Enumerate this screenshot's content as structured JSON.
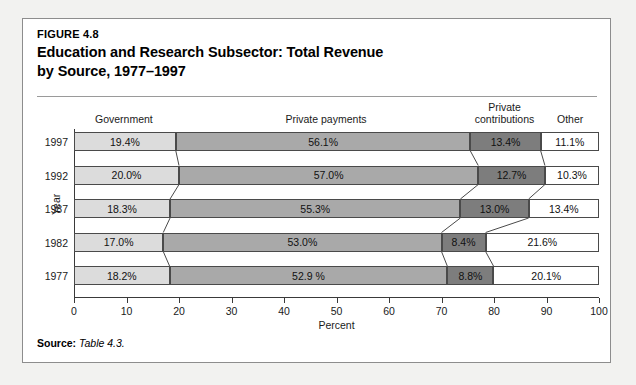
{
  "figure": {
    "number": "FIGURE 4.8",
    "title_line1": "Education and Research Subsector: Total Revenue",
    "title_line2": "by Source, 1977–1997",
    "source_label": "Source:",
    "source_text": "Table 4.3."
  },
  "headers": [
    {
      "label": "Government",
      "center_pct": 9.5
    },
    {
      "label": "Private payments",
      "center_pct": 48
    },
    {
      "label": "Private\ncontributions",
      "line1": "Private",
      "line2": "contributions",
      "center_pct": 82
    },
    {
      "label": "Other",
      "center_pct": 94.5
    }
  ],
  "axis": {
    "x_title": "Percent",
    "y_title": "Year",
    "x_ticks": [
      0,
      10,
      20,
      30,
      40,
      50,
      60,
      70,
      80,
      90,
      100
    ],
    "x_tick_labels": [
      "0",
      "10",
      "20",
      "30",
      "40",
      "50",
      "60",
      "70",
      "80",
      "90",
      "100"
    ],
    "xlim": [
      0,
      100
    ]
  },
  "colors": {
    "government": "#dcdcdc",
    "private_payments": "#a9a9a9",
    "private_contributions": "#7d7d7d",
    "other": "#ffffff",
    "frame_border": "#8d8d8d",
    "axis": "#3a3a3a"
  },
  "chart_data": {
    "type": "bar",
    "orientation": "horizontal",
    "stacked": true,
    "percent_stacked": true,
    "title": "Education and Research Subsector: Total Revenue by Source, 1977–1997",
    "xlabel": "Percent",
    "ylabel": "Year",
    "xlim": [
      0,
      100
    ],
    "grid": false,
    "legend": "column-headers-above-plot",
    "categories": [
      "1997",
      "1992",
      "1987",
      "1982",
      "1977"
    ],
    "series": [
      {
        "name": "Government",
        "values": [
          19.4,
          20.0,
          18.3,
          17.0,
          18.2
        ],
        "labels": [
          "19.4%",
          "20.0%",
          "18.3%",
          "17.0%",
          "18.2%"
        ]
      },
      {
        "name": "Private payments",
        "values": [
          56.1,
          57.0,
          55.3,
          53.0,
          52.9
        ],
        "labels": [
          "56.1%",
          "57.0%",
          "55.3%",
          "53.0%",
          "52.9 %"
        ]
      },
      {
        "name": "Private contributions",
        "values": [
          13.4,
          12.7,
          13.0,
          8.4,
          8.8
        ],
        "labels": [
          "13.4%",
          "12.7%",
          "13.0%",
          "8.4%",
          "8.8%"
        ]
      },
      {
        "name": "Other",
        "values": [
          11.1,
          10.3,
          13.4,
          21.6,
          20.1
        ],
        "labels": [
          "11.1%",
          "10.3%",
          "13.4%",
          "21.6%",
          "20.1%"
        ]
      }
    ]
  }
}
